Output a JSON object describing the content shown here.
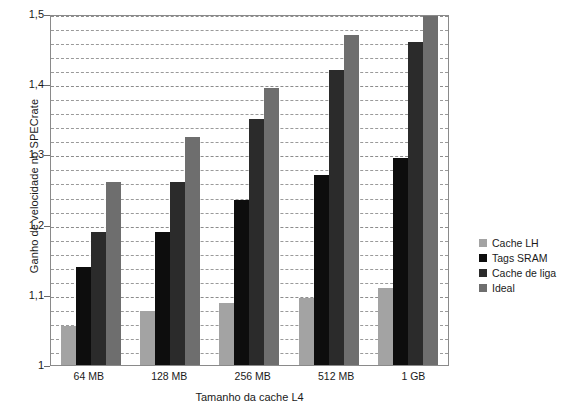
{
  "chart_data": {
    "type": "bar",
    "title": "",
    "xlabel": "Tamanho da cache L4",
    "ylabel": "Ganho de velocidade no SPECrate",
    "categories": [
      "64 MB",
      "128 MB",
      "256 MB",
      "512 MB",
      "1 GB"
    ],
    "series": [
      {
        "name": "Cache LH",
        "color": "#a3a3a3",
        "values": [
          1.055,
          1.077,
          1.088,
          1.096,
          1.11
        ]
      },
      {
        "name": "Tags SRAM",
        "color": "#0d0d0d",
        "values": [
          1.14,
          1.19,
          1.235,
          1.27,
          1.295
        ]
      },
      {
        "name": "Cache de liga",
        "color": "#2b2b2b",
        "values": [
          1.19,
          1.26,
          1.35,
          1.42,
          1.46
        ]
      },
      {
        "name": "Ideal",
        "color": "#6e6e6e",
        "values": [
          1.26,
          1.325,
          1.395,
          1.47,
          1.5
        ]
      }
    ],
    "ylim": [
      1.0,
      1.5
    ],
    "ytick_labels": [
      "1",
      "1,1",
      "1,2",
      "1,3",
      "1,4",
      "1,5"
    ],
    "ytick_values": [
      1.0,
      1.1,
      1.2,
      1.3,
      1.4,
      1.5
    ],
    "minor_tick_step": 0.02,
    "grid": true,
    "grid_style": "dashed-horizontal",
    "legend_position": "right",
    "plot_background": "#ffffff",
    "axis_color": "#8a8a8a",
    "gridline_color": "#9a9a9a"
  }
}
